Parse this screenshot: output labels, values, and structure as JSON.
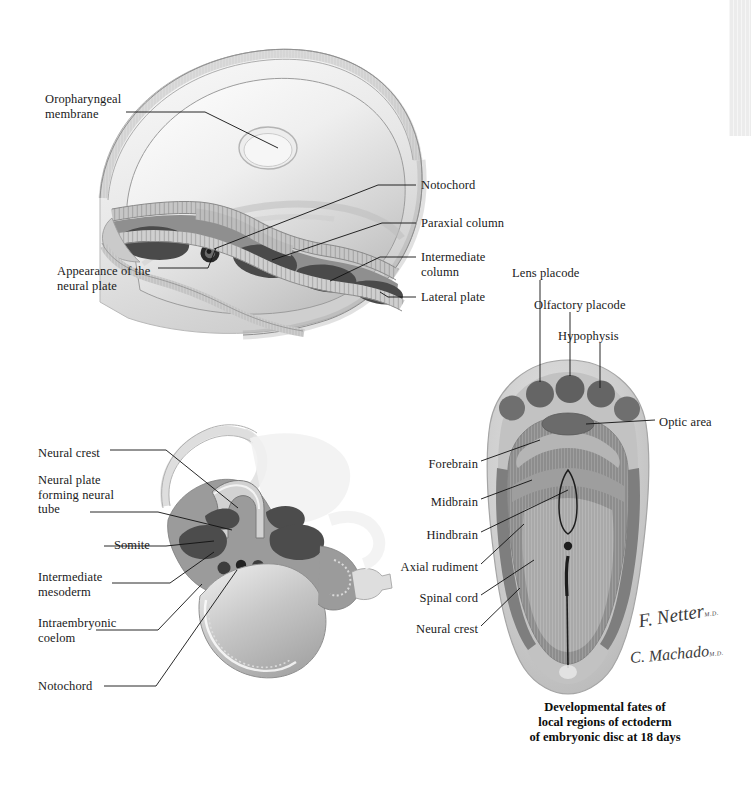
{
  "page": {
    "background_color": "#ffffff",
    "width": 751,
    "height": 787
  },
  "edge_strip": {
    "color": "#ececec"
  },
  "palette": {
    "ectoderm_light": "#d8d8d8",
    "mesoderm_mid": "#9a9a9a",
    "mesoderm_dark": "#4f4f4f",
    "endoderm": "#8c8c8c",
    "disc_rim": "#c9c9c9",
    "disc_body": "#b4b4b4",
    "neural_band": "#8e8e8e",
    "placode": "#6f6f6f",
    "outline": "#111111",
    "label_text": "#1a1a1a",
    "caption_text": "#0d0d0d"
  },
  "figures": [
    {
      "id": "figure-top",
      "name": "dorsal-view-embryonic-disc-neural-plate",
      "labels": [
        {
          "id": "oropharyngeal-membrane",
          "text": "Oropharyngeal\nmembrane",
          "align": "left",
          "x": 45,
          "y": 92
        },
        {
          "id": "appearance-of-neural-plate",
          "text": "Appearance of the\nneural plate",
          "align": "left",
          "x": 57,
          "y": 264
        },
        {
          "id": "notochord",
          "text": "Notochord",
          "align": "left",
          "x": 421,
          "y": 178
        },
        {
          "id": "paraxial-column",
          "text": "Paraxial column",
          "align": "left",
          "x": 421,
          "y": 216
        },
        {
          "id": "intermediate-column",
          "text": "Intermediate\ncolumn",
          "align": "left",
          "x": 421,
          "y": 250
        },
        {
          "id": "lateral-plate",
          "text": "Lateral plate",
          "align": "left",
          "x": 421,
          "y": 290
        }
      ]
    },
    {
      "id": "figure-bottom-left",
      "name": "transverse-section-neural-tube-formation",
      "labels": [
        {
          "id": "neural-crest",
          "text": "Neural crest",
          "align": "left",
          "x": 38,
          "y": 446
        },
        {
          "id": "neural-plate-forming-neural-tube",
          "text": "Neural plate\nforming neural\ntube",
          "align": "left",
          "x": 38,
          "y": 473
        },
        {
          "id": "somite",
          "text": "Somite",
          "align": "left",
          "x": 61,
          "y": 538
        },
        {
          "id": "intermediate-mesoderm",
          "text": "Intermediate\nmesoderm",
          "align": "left",
          "x": 38,
          "y": 570
        },
        {
          "id": "intraembryonic-coelom",
          "text": "Intraembryonic\ncoelom",
          "align": "left",
          "x": 38,
          "y": 616
        },
        {
          "id": "notochord-lower",
          "text": "Notochord",
          "align": "left",
          "x": 38,
          "y": 679
        }
      ]
    },
    {
      "id": "figure-right",
      "name": "ectoderm-fate-map-embryonic-disc",
      "labels": [
        {
          "id": "lens-placode",
          "text": "Lens placode",
          "align": "left",
          "x": 512,
          "y": 266
        },
        {
          "id": "olfactory-placode",
          "text": "Olfactory placode",
          "align": "left",
          "x": 534,
          "y": 298
        },
        {
          "id": "hypophysis",
          "text": "Hypophysis",
          "align": "left",
          "x": 558,
          "y": 329
        },
        {
          "id": "optic-area",
          "text": "Optic area",
          "align": "left",
          "x": 659,
          "y": 415
        },
        {
          "id": "forebrain",
          "text": "Forebrain",
          "align": "right",
          "x": 420,
          "y": 457
        },
        {
          "id": "midbrain",
          "text": "Midbrain",
          "align": "right",
          "x": 420,
          "y": 495
        },
        {
          "id": "hindbrain",
          "text": "Hindbrain",
          "align": "right",
          "x": 420,
          "y": 528
        },
        {
          "id": "axial-rudiment",
          "text": "Axial rudiment",
          "align": "right",
          "x": 395,
          "y": 560
        },
        {
          "id": "spinal-cord",
          "text": "Spinal cord",
          "align": "right",
          "x": 412,
          "y": 591
        },
        {
          "id": "neural-crest-right",
          "text": "Neural crest",
          "align": "right",
          "x": 408,
          "y": 622
        }
      ],
      "caption": "Developmental fates of\nlocal regions of ectoderm\nof embryonic disc at 18 days",
      "caption_x": 605,
      "caption_y": 700
    }
  ],
  "signatures": [
    {
      "id": "netter-signature",
      "text": "F. Netter",
      "suffix": "M.D.",
      "x": 638,
      "y": 606
    },
    {
      "id": "machado-signature",
      "text": "C. Machado",
      "suffix": "M.D.",
      "x": 630,
      "y": 648
    }
  ]
}
